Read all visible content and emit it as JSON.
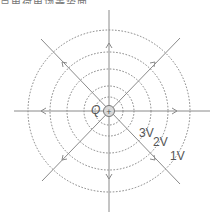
{
  "caption_cropped": "点电荷电场等势面",
  "diagram": {
    "charge_label": "Q",
    "charge_sign": "+",
    "center": [
      109,
      111
    ],
    "ring_radii": [
      14,
      25,
      42,
      59,
      81
    ],
    "equipotential_labels": [
      {
        "text": "3V",
        "x": 139,
        "y": 137
      },
      {
        "text": "2V",
        "x": 153,
        "y": 146
      },
      {
        "text": "1V",
        "x": 170,
        "y": 160
      }
    ],
    "field_line_directions": [
      "up",
      "down",
      "left",
      "right",
      "up-left",
      "up-right",
      "down-left",
      "down-right"
    ],
    "colors": {
      "line": "#8a8a8a",
      "ring": "#666666",
      "charge_fill": "#d8d8d8"
    }
  }
}
